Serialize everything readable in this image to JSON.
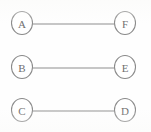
{
  "diagram": {
    "type": "graph",
    "title": "",
    "background_color": "#ffffff",
    "node_stroke_color": "#8a8a8a",
    "edge_stroke_color": "#8d8d8d",
    "label_color": "#6f6f6f",
    "nodes": [
      {
        "id": "A",
        "label": "A",
        "cx": 22,
        "cy": 23,
        "rx": 10.5,
        "ry": 11.5
      },
      {
        "id": "F",
        "label": "F",
        "cx": 125,
        "cy": 23,
        "rx": 10.5,
        "ry": 11.5
      },
      {
        "id": "B",
        "label": "B",
        "cx": 22,
        "cy": 67,
        "rx": 10.5,
        "ry": 11.5
      },
      {
        "id": "E",
        "label": "E",
        "cx": 125,
        "cy": 67,
        "rx": 10.5,
        "ry": 11.5
      },
      {
        "id": "C",
        "label": "C",
        "cx": 22,
        "cy": 110,
        "rx": 10.5,
        "ry": 11.5
      },
      {
        "id": "D",
        "label": "D",
        "cx": 125,
        "cy": 110,
        "rx": 10.5,
        "ry": 11.5
      }
    ],
    "edges": [
      {
        "id": "edge-a-f",
        "from": "A",
        "to": "F",
        "x1": 33,
        "y1": 24,
        "x2": 114,
        "y2": 24
      },
      {
        "id": "edge-b-e",
        "from": "B",
        "to": "E",
        "x1": 33,
        "y1": 68,
        "x2": 114,
        "y2": 68
      },
      {
        "id": "edge-c-d",
        "from": "C",
        "to": "D",
        "x1": 33,
        "y1": 111,
        "x2": 114,
        "y2": 111
      }
    ]
  }
}
